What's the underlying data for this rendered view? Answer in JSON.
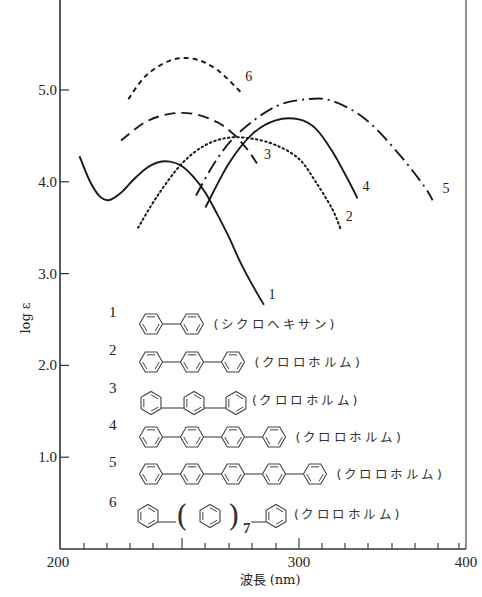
{
  "chart_data": {
    "type": "line",
    "title": "",
    "xlabel": "波長 (nm)",
    "ylabel": "log ε",
    "xlim": [
      200,
      400
    ],
    "ylim": [
      0,
      6
    ],
    "x_ticks": [
      {
        "value": 200,
        "label": "200",
        "px": 60
      },
      {
        "value": 250,
        "label": "",
        "px": 182
      },
      {
        "value": 300,
        "label": "300",
        "px": 299
      },
      {
        "value": 400,
        "label": "400",
        "px": 466
      }
    ],
    "x_minor_ticks_px": [
      84,
      107,
      130,
      153,
      182,
      205,
      229,
      252,
      276,
      299,
      322,
      345,
      368,
      392,
      415,
      438,
      459
    ],
    "y_ticks": [
      {
        "value": 1.0,
        "label": "1.0"
      },
      {
        "value": 2.0,
        "label": "2.0"
      },
      {
        "value": 3.0,
        "label": "3.0"
      },
      {
        "value": 4.0,
        "label": "4.0"
      },
      {
        "value": 5.0,
        "label": "5.0"
      }
    ],
    "grid": false,
    "legend_position": "inside-lower",
    "series": [
      {
        "name": "1",
        "compound": "ビフェニル",
        "solvent": "(シクロヘキサン)",
        "style": "solid",
        "x": [
          208,
          212,
          216,
          220,
          225,
          230,
          235,
          240,
          245,
          250,
          255,
          260,
          265,
          270,
          275,
          280,
          285
        ],
        "y": [
          4.28,
          4.02,
          3.85,
          3.8,
          3.88,
          4.02,
          4.14,
          4.21,
          4.22,
          4.17,
          4.05,
          3.88,
          3.65,
          3.4,
          3.12,
          2.88,
          2.66
        ]
      },
      {
        "name": "2",
        "compound": "p-テルフェニル",
        "solvent": "(クロロホルム)",
        "style": "dotted",
        "x": [
          232,
          240,
          250,
          260,
          270,
          280,
          290,
          300,
          310,
          320,
          325
        ],
        "y": [
          3.5,
          3.85,
          4.2,
          4.4,
          4.48,
          4.47,
          4.4,
          4.25,
          4.0,
          3.7,
          3.48
        ]
      },
      {
        "name": "3",
        "compound": "m-テルフェニル",
        "solvent": "(クロロホルム)",
        "style": "dashed",
        "x": [
          225,
          235,
          245,
          255,
          265,
          272,
          278,
          282
        ],
        "y": [
          4.45,
          4.65,
          4.74,
          4.74,
          4.65,
          4.52,
          4.35,
          4.2
        ]
      },
      {
        "name": "4",
        "compound": "p-クォーターフェニル",
        "solvent": "(クロロホルム)",
        "style": "solid",
        "x": [
          260,
          270,
          280,
          290,
          300,
          310,
          320,
          330,
          335
        ],
        "y": [
          3.72,
          4.2,
          4.52,
          4.67,
          4.68,
          4.58,
          4.33,
          4.0,
          3.82
        ]
      },
      {
        "name": "5",
        "compound": "p-キンクフェニル",
        "solvent": "(クロロホルム)",
        "style": "dash-dot",
        "x": [
          256,
          265,
          275,
          290,
          305,
          320,
          340,
          360,
          375,
          380
        ],
        "y": [
          3.85,
          4.25,
          4.55,
          4.82,
          4.9,
          4.88,
          4.68,
          4.3,
          3.95,
          3.8
        ]
      },
      {
        "name": "6",
        "compound": "p-ノビフェニル (C6H5-(C6H4)7-C6H5)",
        "solvent": "(クロロホルム)",
        "style": "short-dashed",
        "x": [
          228,
          235,
          245,
          255,
          265,
          275
        ],
        "y": [
          4.9,
          5.15,
          5.32,
          5.34,
          5.22,
          4.98
        ]
      }
    ],
    "curve_labels": [
      {
        "text": "1",
        "at_x": 287,
        "at_y": 2.72
      },
      {
        "text": "2",
        "at_x": 328,
        "at_y": 3.57
      },
      {
        "text": "3",
        "at_x": 285,
        "at_y": 4.25
      },
      {
        "text": "4",
        "at_x": 338,
        "at_y": 3.9
      },
      {
        "text": "5",
        "at_x": 386,
        "at_y": 3.88
      },
      {
        "text": "6",
        "at_x": 277,
        "at_y": 5.1
      }
    ]
  },
  "legend": [
    {
      "num": "1",
      "rings": 2,
      "type": "para",
      "solvent": "(シクロヘキサン)"
    },
    {
      "num": "2",
      "rings": 3,
      "type": "para",
      "solvent": "(クロロホルム)"
    },
    {
      "num": "3",
      "rings": 3,
      "type": "meta",
      "solvent": "(クロロホルム)"
    },
    {
      "num": "4",
      "rings": 4,
      "type": "para",
      "solvent": "(クロロホルム)"
    },
    {
      "num": "5",
      "rings": 5,
      "type": "para",
      "solvent": "(クロロホルム)"
    },
    {
      "num": "6",
      "rings": 3,
      "type": "repeat",
      "subscript": "7",
      "solvent": "(クロロホルム)"
    }
  ]
}
